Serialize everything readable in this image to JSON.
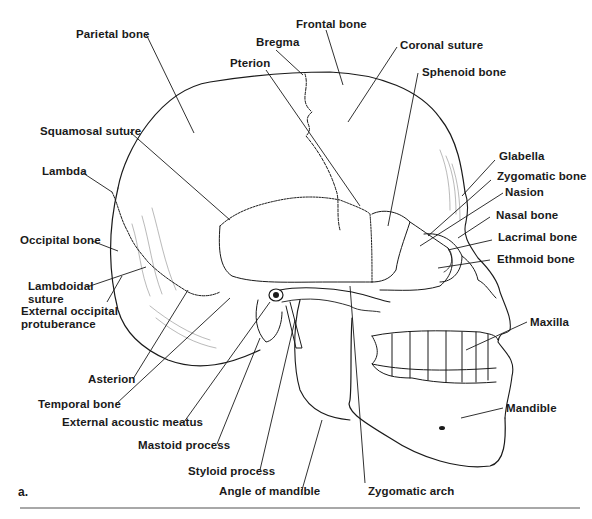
{
  "figure": {
    "panel_letter": "a.",
    "labels": {
      "parietal_bone": "Parietal bone",
      "frontal_bone": "Frontal bone",
      "bregma": "Bregma",
      "coronal_suture": "Coronal suture",
      "pterion": "Pterion",
      "sphenoid_bone": "Sphenoid bone",
      "squamosal_suture": "Squamosal suture",
      "lambda": "Lambda",
      "glabella": "Glabella",
      "zygomatic_bone": "Zygomatic bone",
      "nasion": "Nasion",
      "nasal_bone": "Nasal bone",
      "occipital_bone": "Occipital bone",
      "lacrimal_bone": "Lacrimal bone",
      "ethmoid_bone": "Ethmoid bone",
      "lambdoidal_suture": "Lambdoidal suture",
      "external_occipital_protuberance": "External occipital protuberance",
      "maxilla": "Maxilla",
      "asterion": "Asterion",
      "temporal_bone": "Temporal bone",
      "external_acoustic_meatus": "External acoustic meatus",
      "mandible": "Mandible",
      "mastoid_process": "Mastoid process",
      "styloid_process": "Styloid process",
      "angle_of_mandible": "Angle of mandible",
      "zygomatic_arch": "Zygomatic arch"
    },
    "colors": {
      "ink": "#1a1a1a",
      "rule": "#a8a8a8",
      "background": "#ffffff"
    }
  }
}
